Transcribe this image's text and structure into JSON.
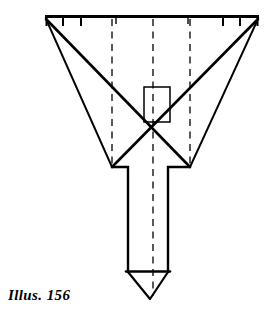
{
  "figure": {
    "caption": "Illus. 156",
    "title": "Illus. 156",
    "type": "technical-line-drawing",
    "background_color": "#ffffff",
    "line_color": "#000000",
    "dash_color": "#000000",
    "stroke_widths": {
      "heavy": 2.6,
      "medium": 1.9,
      "light": 1.3,
      "dashed": 1.2
    },
    "canvas": {
      "width": 273,
      "height": 327
    },
    "top_bar": {
      "name": "scale-bar",
      "x_left": 46,
      "x_right": 258,
      "y": 17,
      "tick_length": 9,
      "tick_positions": [
        46,
        63,
        81,
        116,
        188,
        223,
        240,
        258
      ]
    },
    "wings": {
      "left_tip": [
        46,
        19
      ],
      "right_tip": [
        258,
        19
      ],
      "left_shoulder": [
        112,
        167
      ],
      "right_shoulder": [
        190,
        167
      ],
      "crossing_point": [
        156,
        104
      ]
    },
    "center_box": {
      "name": "center-rectangle",
      "x": 144,
      "y": 87,
      "width": 26,
      "height": 35
    },
    "shaft": {
      "x_left": 128,
      "x_right": 168,
      "y_top": 167,
      "y_base": 272,
      "tip": [
        150,
        299
      ]
    },
    "dashed_lines": [
      {
        "name": "dashed-line-left",
        "x": 112,
        "y_top": 19,
        "y_bottom": 168
      },
      {
        "name": "dashed-line-center",
        "x": 153,
        "y_top": 19,
        "y_bottom": 296
      },
      {
        "name": "dashed-line-right",
        "x": 190,
        "y_top": 19,
        "y_bottom": 168
      }
    ]
  }
}
